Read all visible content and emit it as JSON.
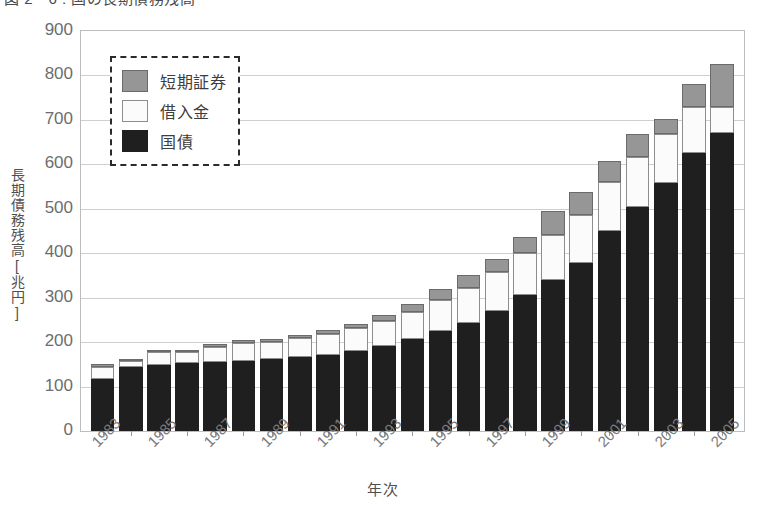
{
  "figure": {
    "title": "図 2－6 : 国の長期債務残高"
  },
  "chart_data": {
    "type": "bar",
    "stacked": true,
    "title": "図 2－6 : 国の長期債務残高",
    "xlabel": "年次",
    "ylabel": "長期債務残高[兆円]",
    "ylim": [
      0,
      900
    ],
    "ytick_step": 100,
    "yticks": [
      "900",
      "800",
      "700",
      "600",
      "500",
      "400",
      "300",
      "200",
      "100",
      "0"
    ],
    "grid": true,
    "legend_position": "upper-left",
    "categories": [
      "1983",
      "1984",
      "1985",
      "1986",
      "1987",
      "1988",
      "1989",
      "1990",
      "1991",
      "1992",
      "1993",
      "1994",
      "1995",
      "1996",
      "1997",
      "1998",
      "1999",
      "2000",
      "2001",
      "2002",
      "2003",
      "2004",
      "2005"
    ],
    "xtick_labels": [
      "1983",
      "1985",
      "1987",
      "1989",
      "1991",
      "1993",
      "1995",
      "1997",
      "1999",
      "2001",
      "2003",
      "2005"
    ],
    "series": [
      {
        "name": "国債",
        "color": "#1f1f1f",
        "values": [
          117,
          144,
          148,
          152,
          155,
          157,
          161,
          166,
          172,
          180,
          192,
          206,
          225,
          244,
          270,
          307,
          339,
          379,
          449,
          504,
          557,
          625,
          670
        ]
      },
      {
        "name": "借入金",
        "color": "#fbfbfb",
        "values": [
          28,
          14,
          30,
          26,
          35,
          40,
          40,
          44,
          47,
          51,
          55,
          62,
          70,
          78,
          87,
          94,
          102,
          108,
          111,
          112,
          111,
          104,
          60
        ]
      },
      {
        "name": "短期証券",
        "color": "#969696",
        "values": [
          6,
          5,
          4,
          4,
          6,
          7,
          6,
          7,
          8,
          9,
          15,
          18,
          25,
          30,
          30,
          35,
          55,
          51,
          48,
          52,
          34,
          52,
          96
        ]
      }
    ],
    "totals": [
      151,
      163,
      182,
      182,
      196,
      204,
      207,
      217,
      227,
      240,
      262,
      286,
      320,
      352,
      387,
      436,
      496,
      538,
      608,
      668,
      702,
      781,
      826
    ]
  },
  "legend": {
    "items": [
      {
        "label": "短期証券",
        "color": "#969696"
      },
      {
        "label": "借入金",
        "color": "#fbfbfb"
      },
      {
        "label": "国債",
        "color": "#1f1f1f"
      }
    ]
  }
}
